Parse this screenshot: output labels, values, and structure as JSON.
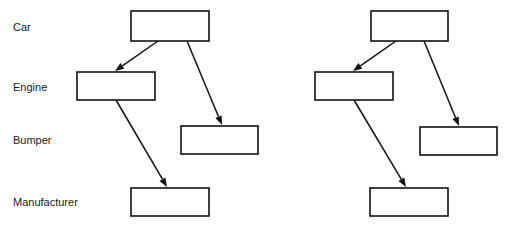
{
  "diagram": {
    "background_color": "#ffffff",
    "line_color": "#111111",
    "box_fill_color": "#ffffff",
    "text_color": "#1a1a1a",
    "row_labels": [
      {
        "id": "car",
        "text": "Car",
        "x": 13,
        "y": 28
      },
      {
        "id": "engine",
        "text": "Engine",
        "x": 13,
        "y": 88
      },
      {
        "id": "bumper",
        "text": "Bumper",
        "x": 13,
        "y": 141
      },
      {
        "id": "manufacturer",
        "text": "Manufacturer",
        "x": 13,
        "y": 203
      }
    ],
    "diagrams": [
      {
        "id": "left-diagram",
        "name": "left",
        "boxes": [
          {
            "id": "left-car-box",
            "role": "car",
            "x": 131,
            "y": 11,
            "w": 78,
            "h": 30
          },
          {
            "id": "left-engine-box",
            "role": "engine",
            "x": 77,
            "y": 72,
            "w": 78,
            "h": 28
          },
          {
            "id": "left-bumper-box",
            "role": "bumper",
            "x": 181,
            "y": 126,
            "w": 77,
            "h": 28
          },
          {
            "id": "left-manufacturer-box",
            "role": "manufacturer",
            "x": 131,
            "y": 188,
            "w": 78,
            "h": 28
          }
        ],
        "edges": [
          {
            "id": "left-car-to-engine",
            "from": "car",
            "to": "engine",
            "x1": 158,
            "y1": 41,
            "x2": 115,
            "y2": 71
          },
          {
            "id": "left-car-to-bumper",
            "from": "car",
            "to": "bumper",
            "x1": 187,
            "y1": 41,
            "x2": 222,
            "y2": 125
          },
          {
            "id": "left-engine-to-manufacturer",
            "from": "engine",
            "to": "manufacturer",
            "x1": 116,
            "y1": 100,
            "x2": 167,
            "y2": 187
          }
        ]
      },
      {
        "id": "right-diagram",
        "name": "right",
        "boxes": [
          {
            "id": "right-car-box",
            "role": "car",
            "x": 371,
            "y": 11,
            "w": 77,
            "h": 30
          },
          {
            "id": "right-engine-box",
            "role": "engine",
            "x": 315,
            "y": 72,
            "w": 78,
            "h": 28
          },
          {
            "id": "right-bumper-box",
            "role": "bumper",
            "x": 420,
            "y": 127,
            "w": 77,
            "h": 28
          },
          {
            "id": "right-manufacturer-box",
            "role": "manufacturer",
            "x": 370,
            "y": 188,
            "w": 78,
            "h": 28
          }
        ],
        "edges": [
          {
            "id": "right-car-to-engine",
            "from": "car",
            "to": "engine",
            "x1": 396,
            "y1": 41,
            "x2": 353,
            "y2": 71
          },
          {
            "id": "right-car-to-bumper",
            "from": "car",
            "to": "bumper",
            "x1": 424,
            "y1": 41,
            "x2": 459,
            "y2": 126
          },
          {
            "id": "right-engine-to-manufacturer",
            "from": "engine",
            "to": "manufacturer",
            "x1": 354,
            "y1": 100,
            "x2": 406,
            "y2": 187
          }
        ]
      }
    ]
  }
}
